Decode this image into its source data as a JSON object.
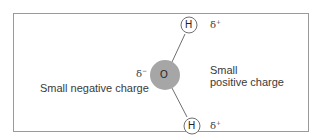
{
  "diagram": {
    "type": "water-molecule-polarity",
    "atoms": [
      {
        "id": "O",
        "label": "O",
        "fill": "#a6a6a6"
      },
      {
        "id": "H1",
        "label": "H",
        "fill": "#ffffff"
      },
      {
        "id": "H2",
        "label": "H",
        "fill": "#ffffff"
      }
    ],
    "charges": {
      "oxygen": {
        "symbol": "δ",
        "sign": "−"
      },
      "hydrogen_top": {
        "symbol": "δ",
        "sign": "+"
      },
      "hydrogen_bottom": {
        "symbol": "δ",
        "sign": "+"
      }
    },
    "labels": {
      "negative": "Small negative charge",
      "positive_line1": "Small",
      "positive_line2": "positive charge"
    },
    "colors": {
      "border": "#9a9a9a",
      "oxygen_fill": "#a6a6a6",
      "bond": "#6f6f6f",
      "text": "#3a3a3a"
    }
  }
}
